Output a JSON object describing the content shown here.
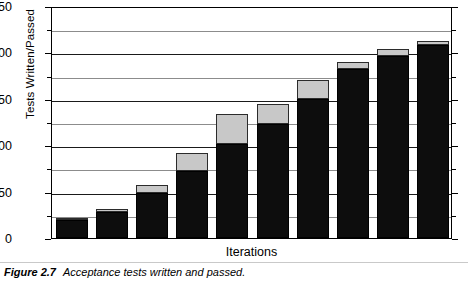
{
  "figure": {
    "caption_label": "Figure 2.7",
    "caption_text": "Acceptance tests written and passed."
  },
  "chart_data": {
    "type": "bar",
    "title": "",
    "subtitle": "",
    "xlabel": "Iterations",
    "ylabel": "Tests Written/Passed",
    "ylim": [
      0,
      250
    ],
    "xlim_categories": 10,
    "grid": true,
    "grid_major_step": 50,
    "grid_minor_step": 25,
    "legend": "none",
    "legend_position": "none",
    "stacked": true,
    "categories": [
      "1",
      "2",
      "3",
      "4",
      "5",
      "6",
      "7",
      "8",
      "9",
      "10"
    ],
    "y_ticks": [
      0,
      50,
      100,
      150,
      200,
      250
    ],
    "y_tick_labels": [
      "0",
      "50",
      "100",
      "150",
      "200",
      "250"
    ],
    "y_minor_ticks": [
      25,
      75,
      125,
      175,
      225
    ],
    "series": [
      {
        "name": "Tests passed",
        "color": "#0d0d0d",
        "values": [
          19,
          28,
          48,
          72,
          101,
          123,
          150,
          182,
          196,
          208
        ]
      },
      {
        "name": "Tests written (not yet passed)",
        "color": "#c8c8c8",
        "values": [
          2,
          3,
          9,
          20,
          33,
          21,
          20,
          8,
          8,
          4
        ]
      }
    ],
    "totals": [
      21,
      31,
      57,
      92,
      134,
      144,
      170,
      190,
      204,
      212
    ],
    "annotations": []
  }
}
